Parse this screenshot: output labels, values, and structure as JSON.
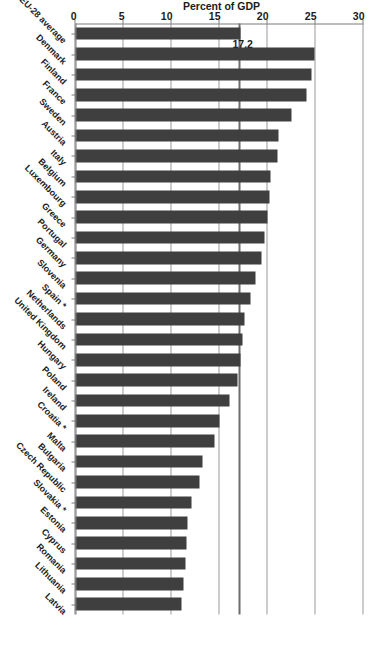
{
  "chart_data": {
    "type": "bar",
    "orientation": "horizontal",
    "title": "",
    "xlabel": "",
    "ylabel": "Percent of GDP",
    "ylim": [
      0,
      30
    ],
    "yticks": [
      0,
      5,
      10,
      15,
      20,
      25,
      30
    ],
    "ytick_labels": [
      "0",
      "5",
      "10",
      "15",
      "20",
      "25",
      "30"
    ],
    "grid": true,
    "legend": null,
    "bar_color": "#3f3f3f",
    "gridline_color": "#9a9a9a",
    "annotations": [
      {
        "name": "eu28-average-line",
        "label": "17.2",
        "value": 17.2
      }
    ],
    "categories": [
      "EU-28 average",
      "Denmark",
      "Finland",
      "France",
      "Sweden",
      "Austria",
      "Italy",
      "Belgium",
      "Luxembourg",
      "Greece",
      "Portugal",
      "Germany",
      "Slovenia",
      "Spain *",
      "Netherlands",
      "United Kingdom",
      "Hungary",
      "Poland",
      "Ireland",
      "Croatia *",
      "Malta",
      "Bulgaria",
      "Czech Republic",
      "Slovakia *",
      "Estonia",
      "Cyprus",
      "Romania",
      "Lithuania",
      "Latvia"
    ],
    "values": [
      17.2,
      24.9,
      24.6,
      24.1,
      22.5,
      21.1,
      21.0,
      20.3,
      20.2,
      20.0,
      19.7,
      19.4,
      18.7,
      18.2,
      17.6,
      17.4,
      17.2,
      16.9,
      16.0,
      15.0,
      14.5,
      13.2,
      12.9,
      12.1,
      11.7,
      11.6,
      11.5,
      11.2,
      11.0
    ]
  }
}
